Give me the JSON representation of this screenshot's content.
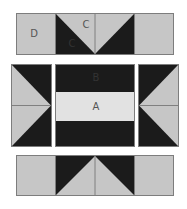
{
  "colors": {
    "light": "#c6c6c6",
    "dark": "#1b1b1b",
    "band": "#e2e2e2",
    "seam": "#7d7d7d"
  },
  "diagram": {
    "labels": {
      "top_square": "D",
      "top_flying_geese": "C",
      "top_flying_geese_dark": "C",
      "center_band": "B",
      "center_strip": "A"
    },
    "rows": [
      {
        "name": "top-row",
        "units": [
          "square D",
          "flying-geese C (points down)",
          "square"
        ]
      },
      {
        "name": "middle-row",
        "units": [
          "flying-geese (points right)",
          "strip set B/A/B",
          "flying-geese (points left)"
        ]
      },
      {
        "name": "bottom-row",
        "units": [
          "square",
          "flying-geese (points up)",
          "square"
        ]
      }
    ]
  }
}
